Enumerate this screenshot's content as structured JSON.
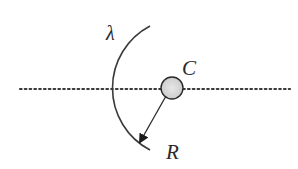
{
  "diagram": {
    "labels": {
      "arc": "λ",
      "center": "C",
      "radius": "R"
    },
    "colors": {
      "stroke": "#3a3a3a",
      "dots": "#3a3a3a",
      "center_fill": "#d4d4d4",
      "background": "#ffffff"
    },
    "elements": [
      {
        "type": "dotted-axis",
        "description": "horizontal dotted line through center"
      },
      {
        "type": "arc",
        "label": "λ",
        "description": "circular arc of charge, left of center"
      },
      {
        "type": "point",
        "label": "C",
        "description": "center of curvature, grey filled circle"
      },
      {
        "type": "arrow",
        "label": "R",
        "description": "radius arrow from C to the arc"
      }
    ]
  }
}
